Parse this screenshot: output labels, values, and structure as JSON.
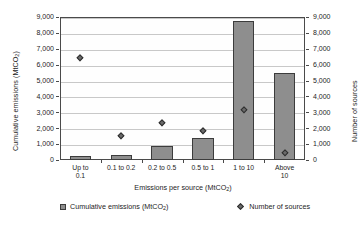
{
  "chart_data": {
    "type": "bar",
    "title": "",
    "categories": [
      "Up to\n0.1",
      "0.1 to 0.2",
      "0.2 to 0.5",
      "0.5 to 1",
      "1 to 10",
      "Above\n10"
    ],
    "series": [
      {
        "name": "Cumulative emissions (MtCO2)",
        "type": "bar",
        "axis": "left",
        "values": [
          230,
          330,
          900,
          1380,
          8750,
          5500
        ]
      },
      {
        "name": "Number of sources",
        "type": "scatter",
        "axis": "right",
        "values": [
          6400,
          1500,
          2350,
          1800,
          3150,
          450
        ]
      }
    ],
    "xlabel": "Emissions per source (MtCO2)",
    "ylabel": "Cumulative emissions (MtCO2)",
    "ylabel_right": "Number of sources",
    "ylim": [
      0,
      9000
    ],
    "ylim_right": [
      0,
      9000
    ],
    "yticks": [
      0,
      1000,
      2000,
      3000,
      4000,
      5000,
      6000,
      7000,
      8000,
      9000
    ],
    "ytick_labels": [
      "0",
      "1,000",
      "2,000",
      "3,000",
      "4,000",
      "5,000",
      "6,000",
      "7,000",
      "8,000",
      "9,000"
    ],
    "grid": true,
    "legend_position": "bottom",
    "colors": {
      "bar_fill": "#8e8e8e",
      "bar_edge": "#3c3c3c",
      "marker_fill": "#6a6a6a",
      "marker_edge": "#2e2e2e",
      "gridline": "#c8c8c8",
      "axis": "#4a4a4a",
      "background": "#ffffff"
    }
  },
  "axes": {
    "left_title_main": "Cumulative emissions (MtCO",
    "left_title_sub": "2",
    "left_title_tail": ")",
    "right_title": "Number of sources",
    "x_title_main": "Emissions per source (MtCO",
    "x_title_sub": "2",
    "x_title_tail": ")"
  },
  "legend": {
    "items": [
      {
        "marker": "square-marker",
        "label_main": "Cumulative emissions (MtCO",
        "label_sub": "2",
        "label_tail": ")"
      },
      {
        "marker": "diamond-marker",
        "label_main": "Number of sources",
        "label_sub": "",
        "label_tail": ""
      }
    ]
  }
}
